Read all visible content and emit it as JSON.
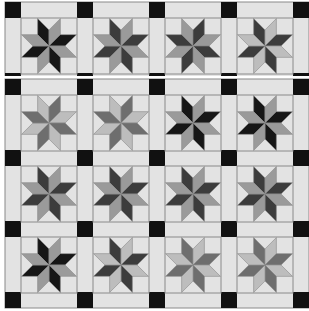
{
  "colors": {
    "background": "#ffffff",
    "fabric": "#e3e3e3",
    "seam": "#8a8a8a",
    "cornerstone": "#111111",
    "black": "#161616",
    "dark": "#3c3c3c",
    "mid": "#6e6e6e",
    "gray": "#9a9a9a",
    "light": "#bdbdbd"
  },
  "layout": {
    "block_size": 56,
    "sash_width": 16,
    "pitch_x": 72,
    "pitch_y": 71,
    "origin_x": 5,
    "top_strip": {
      "y": 2,
      "rows": 1,
      "cols": 4
    },
    "main_quilt": {
      "y": 79,
      "rows": 3,
      "cols": 4
    }
  },
  "top_strip": {
    "blocks": [
      {
        "a": "black",
        "b": "gray"
      },
      {
        "a": "dark",
        "b": "gray"
      },
      {
        "a": "gray",
        "b": "dark"
      },
      {
        "a": "dark",
        "b": "light"
      }
    ]
  },
  "main_quilt": {
    "rows": [
      [
        {
          "a": "light",
          "b": "mid"
        },
        {
          "a": "light",
          "b": "mid"
        },
        {
          "a": "black",
          "b": "gray"
        },
        {
          "a": "black",
          "b": "gray"
        }
      ],
      [
        {
          "a": "dark",
          "b": "gray"
        },
        {
          "a": "dark",
          "b": "gray"
        },
        {
          "a": "dark",
          "b": "gray"
        },
        {
          "a": "dark",
          "b": "gray"
        }
      ],
      [
        {
          "a": "black",
          "b": "gray"
        },
        {
          "a": "dark",
          "b": "light"
        },
        {
          "a": "mid",
          "b": "light"
        },
        {
          "a": "mid",
          "b": "light"
        }
      ]
    ]
  }
}
